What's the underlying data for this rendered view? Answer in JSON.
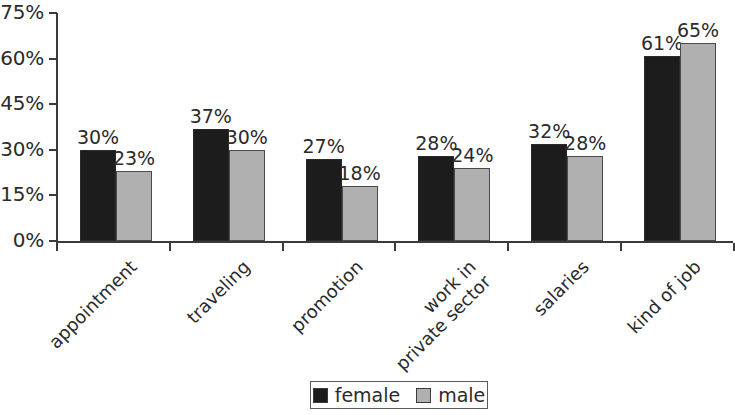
{
  "chart_data": {
    "type": "bar",
    "title": "",
    "subtitle": "",
    "xlabel": "",
    "ylabel": "",
    "grid": false,
    "legend_position": "bottom-center",
    "ylim": [
      0,
      75
    ],
    "y_ticks": [
      "0%",
      "15%",
      "30%",
      "45%",
      "60%",
      "75%"
    ],
    "y_tick_values": [
      0,
      15,
      30,
      45,
      60,
      75
    ],
    "categories": [
      "appointment",
      "traveling",
      "promotion",
      "work in\nprivate sector",
      "salaries",
      "kind of job"
    ],
    "series": [
      {
        "name": "female",
        "color": "#1c1c1c",
        "values": [
          30,
          37,
          27,
          28,
          32,
          61
        ],
        "value_labels": [
          "30%",
          "37%",
          "27%",
          "28%",
          "32%",
          "61%"
        ]
      },
      {
        "name": "male",
        "color": "#b0b0b0",
        "values": [
          23,
          30,
          18,
          24,
          28,
          65
        ],
        "value_labels": [
          "23%",
          "30%",
          "18%",
          "24%",
          "28%",
          "65%"
        ]
      }
    ]
  },
  "legend": {
    "items": [
      {
        "label": "female",
        "swatch": "female"
      },
      {
        "label": "male",
        "swatch": "male"
      }
    ]
  },
  "axis": {
    "y_tick_labels": [
      "75%",
      "60%",
      "45%",
      "30%",
      "15%",
      "0%"
    ]
  }
}
